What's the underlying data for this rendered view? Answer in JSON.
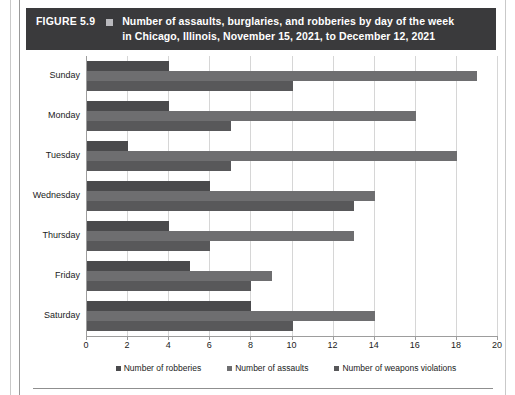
{
  "figure": {
    "number_label": "FIGURE 5.9",
    "bullet_icon": "square-bullet-icon",
    "title_line_1": "Number of assaults, burglaries, and robberies by day of the week",
    "title_line_2": "in Chicago, Illinois, November 15, 2021, to December 12, 2021",
    "banner_color": "#3a3a3c"
  },
  "chart_data": {
    "type": "bar",
    "orientation": "horizontal",
    "title": "Number of assaults, burglaries, and robberies by day of the week in Chicago, Illinois, November 15, 2021, to December 12, 2021",
    "xlabel": "",
    "ylabel": "",
    "categories": [
      "Sunday",
      "Monday",
      "Tuesday",
      "Wednesday",
      "Thursday",
      "Friday",
      "Saturday"
    ],
    "series": [
      {
        "name": "Number of robberies",
        "color": "#4a4a4c",
        "values": [
          4,
          4,
          2,
          6,
          4,
          5,
          8
        ]
      },
      {
        "name": "Number of assaults",
        "color": "#6e6e70",
        "values": [
          19,
          16,
          18,
          14,
          13,
          9,
          14
        ]
      },
      {
        "name": "Number of weapons violations",
        "color": "#58585a",
        "values": [
          10,
          7,
          7,
          13,
          6,
          8,
          10
        ]
      }
    ],
    "xlim": [
      0,
      20
    ],
    "xticks": [
      0,
      2,
      4,
      6,
      8,
      10,
      12,
      14,
      16,
      18,
      20
    ],
    "xtick_labels": [
      "0",
      "2",
      "4",
      "6",
      "8",
      "10",
      "12",
      "14",
      "16",
      "18",
      "20"
    ],
    "grid": true,
    "grid_axis": "x",
    "legend_position": "bottom"
  }
}
